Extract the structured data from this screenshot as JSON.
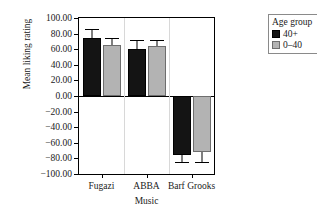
{
  "chart_data": {
    "type": "bar",
    "title": "",
    "xlabel": "Music",
    "ylabel": "Mean liking rating",
    "categories": [
      "Fugazi",
      "ABBA",
      "Barf Grooks"
    ],
    "ylim": [
      -100,
      100
    ],
    "ytick_labels": [
      "100.00",
      "80.00",
      "60.00",
      "40.00",
      "20.00",
      "0.00",
      "−20.00",
      "−40.00",
      "−60.00",
      "−80.00",
      "−100.00"
    ],
    "ytick_values": [
      100,
      80,
      60,
      40,
      20,
      0,
      -20,
      -40,
      -60,
      -80,
      -100
    ],
    "grid": false,
    "legend_position": "right-outside",
    "legend_title": "Age group",
    "series": [
      {
        "name": "40+",
        "color": "#141414",
        "values": [
          74,
          60,
          -76
        ],
        "errors": [
          12,
          12,
          9
        ]
      },
      {
        "name": "0–40",
        "color": "#b3b3b3",
        "values": [
          66,
          64,
          -72
        ],
        "errors": [
          9,
          8,
          13
        ]
      }
    ]
  },
  "legend": {
    "title": "Age group",
    "entries": [
      {
        "label": "40+",
        "swatch": "dark"
      },
      {
        "label": "0–40",
        "swatch": "light"
      }
    ]
  },
  "axes": {
    "y_title": "Mean liking rating",
    "x_title": "Music"
  }
}
